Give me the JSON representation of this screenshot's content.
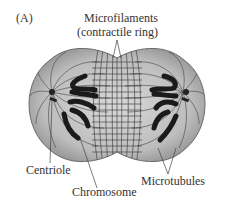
{
  "figure": {
    "panel_label": "(A)",
    "labels": {
      "microfilaments_line1": "Microfilaments",
      "microfilaments_line2": "(contractile ring)",
      "centriole": "Centriole",
      "chromosome": "Chromosome",
      "microtubules": "Microtubules"
    },
    "colors": {
      "cell_fill": "#b9b9b9",
      "cell_edge": "#6a6a6a",
      "chromosome": "#1a1a1a",
      "fiber": "#555555",
      "text": "#333333"
    }
  }
}
